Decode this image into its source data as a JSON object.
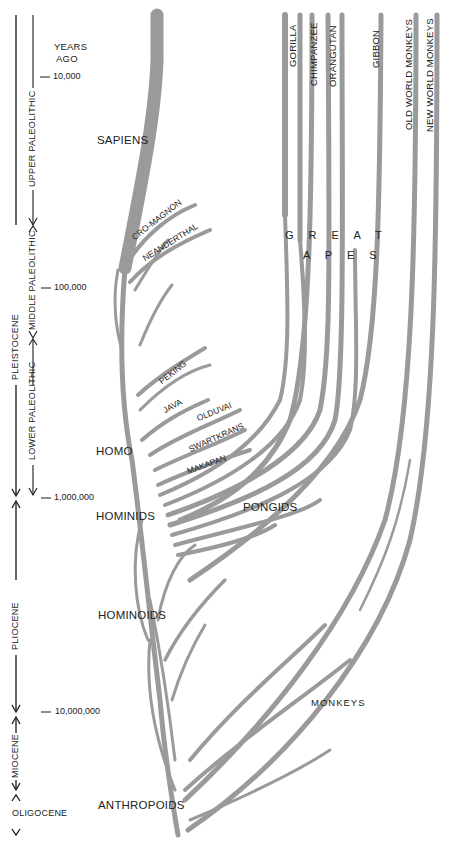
{
  "diagram": {
    "type": "phylogenetic-tree",
    "branch_color": "#9a9a9a",
    "text_color": "#1a1a1a",
    "time_axis": {
      "header": [
        "YEARS",
        "AGO"
      ],
      "ticks": [
        {
          "label": "10,000",
          "y": 76
        },
        {
          "label": "100,000",
          "y": 287
        },
        {
          "label": "1,000,000",
          "y": 497
        },
        {
          "label": "10,000,000",
          "y": 712
        }
      ]
    },
    "epochs": [
      {
        "label": "PLEISTOCENE"
      },
      {
        "label": "PLIOCENE"
      },
      {
        "label": "MIOCENE"
      },
      {
        "label": "OLIGOCENE"
      }
    ],
    "cultural_periods": [
      {
        "label": "UPPER PALEOLITHIC"
      },
      {
        "label": "MIDDLE PALEOLITHIC"
      },
      {
        "label": "LOWER PALEOLITHIC"
      }
    ],
    "group_labels": {
      "sapiens": "SAPIENS",
      "homo": "HOMO",
      "hominids": "HOMINIDS",
      "hominoids": "HOMINOIDS",
      "anthropoids": "ANTHROPOIDS",
      "pongids": "PONGIDS",
      "monkeys": "MONKEYS",
      "great_apes_line1": "G R E A T",
      "great_apes_line2": "A P E S"
    },
    "hominid_labels": {
      "cro_magnon": "CRO-MAGNON",
      "neanderthal": "NEANDERTHAL",
      "peking": "PEKING",
      "java": "JAVA",
      "olduvai": "OLDUVAI",
      "swartkrans": "SWARTKRANS",
      "makapan": "MAKAPAN"
    },
    "living_taxa": [
      {
        "label": "GORILLA"
      },
      {
        "label": "CHIMPANZEE"
      },
      {
        "label": "ORANGUTAN"
      },
      {
        "label": "GIBBON"
      },
      {
        "label": "OLD WORLD MONKEYS"
      },
      {
        "label": "NEW WORLD MONKEYS"
      }
    ]
  }
}
